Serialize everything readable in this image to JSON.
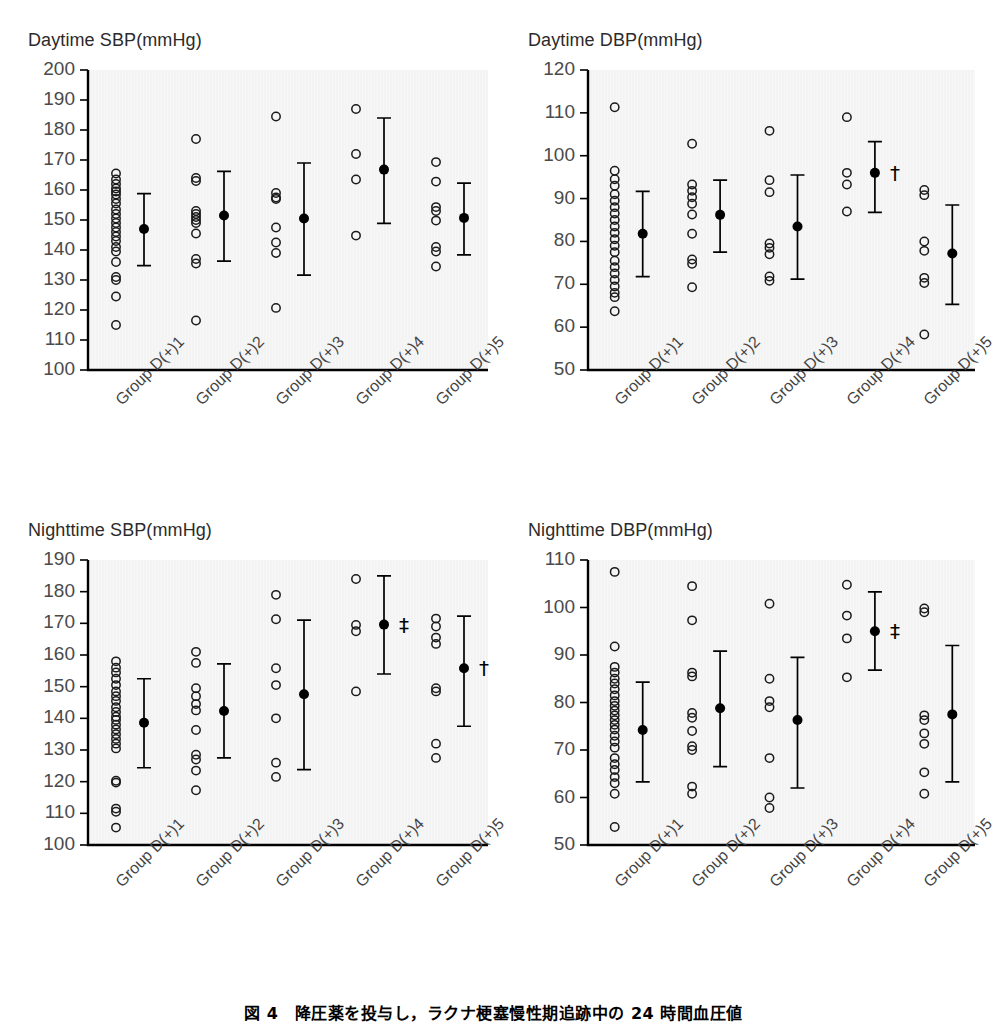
{
  "caption": "図 4　降圧薬を投与し，ラクナ梗塞慢性期追跡中の 24 時間血圧値",
  "groups": [
    "Group D(+)1",
    "Group D(+)2",
    "Group D(+)3",
    "Group D(+)4",
    "Group D(+)5"
  ],
  "chart_data": [
    {
      "id": "daytime-sbp",
      "type": "scatter",
      "title": "Daytime SBP(mmHg)",
      "xlabel": "",
      "ylabel": "Daytime SBP(mmHg)",
      "ylim": [
        100,
        200
      ],
      "yticks": [
        100,
        110,
        120,
        130,
        140,
        150,
        160,
        170,
        180,
        190,
        200
      ],
      "grid": false,
      "legend": "none",
      "categories": [
        "Group D(+)1",
        "Group D(+)2",
        "Group D(+)3",
        "Group D(+)4",
        "Group D(+)5"
      ],
      "series": [
        {
          "name": "Group D(+)1",
          "points": [
            165.5,
            163.5,
            162,
            160.5,
            159.5,
            158.5,
            157,
            155.5,
            153.5,
            152,
            150.5,
            149,
            147.5,
            146,
            144.5,
            143,
            141,
            139.5,
            136,
            131,
            130,
            124.5,
            115
          ],
          "mean": 147.0,
          "sd_low": 134.8,
          "sd_high": 158.8,
          "significance": ""
        },
        {
          "name": "Group D(+)2",
          "points": [
            177,
            164,
            163,
            153,
            152,
            151,
            150,
            149,
            145.5,
            137,
            135.5,
            116.5
          ],
          "mean": 151.5,
          "sd_low": 136.3,
          "sd_high": 166.2,
          "significance": ""
        },
        {
          "name": "Group D(+)3",
          "points": [
            184.5,
            159,
            157.5,
            157,
            147.5,
            142.5,
            139,
            120.7
          ],
          "mean": 150.5,
          "sd_low": 131.6,
          "sd_high": 169.0,
          "significance": ""
        },
        {
          "name": "Group D(+)4",
          "points": [
            187,
            172,
            163.5,
            144.8
          ],
          "mean": 166.8,
          "sd_low": 148.9,
          "sd_high": 184.0,
          "significance": ""
        },
        {
          "name": "Group D(+)5",
          "points": [
            169.3,
            162.8,
            154.3,
            153,
            149.8,
            141,
            139.5,
            134.5
          ],
          "mean": 150.7,
          "sd_low": 138.4,
          "sd_high": 162.3,
          "significance": ""
        }
      ]
    },
    {
      "id": "daytime-dbp",
      "type": "scatter",
      "title": "Daytime DBP(mmHg)",
      "xlabel": "",
      "ylabel": "Daytime DBP(mmHg)",
      "ylim": [
        50,
        120
      ],
      "yticks": [
        50,
        60,
        70,
        80,
        90,
        100,
        110,
        120
      ],
      "grid": false,
      "legend": "none",
      "categories": [
        "Group D(+)1",
        "Group D(+)2",
        "Group D(+)3",
        "Group D(+)4",
        "Group D(+)5"
      ],
      "series": [
        {
          "name": "Group D(+)1",
          "points": [
            111.3,
            96.5,
            94.5,
            93,
            91,
            89.5,
            88,
            86.5,
            85,
            83.5,
            82,
            80.5,
            79,
            77.5,
            75.5,
            74,
            72.5,
            71,
            69.5,
            68,
            67,
            63.7
          ],
          "mean": 81.8,
          "sd_low": 71.8,
          "sd_high": 91.7,
          "significance": ""
        },
        {
          "name": "Group D(+)2",
          "points": [
            102.8,
            93.3,
            91.8,
            90.3,
            88.8,
            86.3,
            81.8,
            75.8,
            74.8,
            69.3
          ],
          "mean": 86.2,
          "sd_low": 77.5,
          "sd_high": 94.3,
          "significance": ""
        },
        {
          "name": "Group D(+)3",
          "points": [
            105.8,
            94.3,
            91.5,
            79.5,
            78.5,
            77,
            71.8,
            70.8
          ],
          "mean": 83.5,
          "sd_low": 71.2,
          "sd_high": 95.5,
          "significance": ""
        },
        {
          "name": "Group D(+)4",
          "points": [
            109,
            96,
            93.3,
            87
          ],
          "mean": 96.0,
          "sd_low": 86.8,
          "sd_high": 103.3,
          "significance": "†"
        },
        {
          "name": "Group D(+)5",
          "points": [
            92,
            90.8,
            80,
            77.8,
            71.5,
            70.3,
            58.3
          ],
          "mean": 77.2,
          "sd_low": 65.3,
          "sd_high": 88.5,
          "significance": ""
        }
      ]
    },
    {
      "id": "nighttime-sbp",
      "type": "scatter",
      "title": "Nighttime SBP(mmHg)",
      "xlabel": "",
      "ylabel": "Nighttime SBP(mmHg)",
      "ylim": [
        100,
        190
      ],
      "yticks": [
        100,
        110,
        120,
        130,
        140,
        150,
        160,
        170,
        180,
        190
      ],
      "grid": false,
      "legend": "none",
      "categories": [
        "Group D(+)1",
        "Group D(+)2",
        "Group D(+)3",
        "Group D(+)4",
        "Group D(+)5"
      ],
      "series": [
        {
          "name": "Group D(+)1",
          "points": [
            158,
            156,
            154.5,
            152.5,
            150.5,
            148.5,
            147,
            145.5,
            143.5,
            142,
            140.5,
            139.5,
            138,
            136.5,
            135,
            133.5,
            132,
            130.5,
            120.3,
            119.7,
            111.5,
            110.5,
            105.5
          ],
          "mean": 138.6,
          "sd_low": 124.4,
          "sd_high": 152.5,
          "significance": ""
        },
        {
          "name": "Group D(+)2",
          "points": [
            161,
            157.5,
            149.5,
            147,
            144.5,
            142.5,
            136.3,
            128.5,
            127,
            123.5,
            117.3
          ],
          "mean": 142.3,
          "sd_low": 127.5,
          "sd_high": 157.2,
          "significance": ""
        },
        {
          "name": "Group D(+)3",
          "points": [
            179,
            171.3,
            155.8,
            150.5,
            140,
            126,
            121.5
          ],
          "mean": 147.6,
          "sd_low": 123.8,
          "sd_high": 171.0,
          "significance": ""
        },
        {
          "name": "Group D(+)4",
          "points": [
            184,
            169.5,
            167.5,
            148.5
          ],
          "mean": 169.6,
          "sd_low": 154.0,
          "sd_high": 185.0,
          "significance": "‡"
        },
        {
          "name": "Group D(+)5",
          "points": [
            171.5,
            169,
            165.5,
            163.5,
            149.5,
            148.5,
            132,
            127.5
          ],
          "mean": 155.8,
          "sd_low": 137.5,
          "sd_high": 172.3,
          "significance": "†"
        }
      ]
    },
    {
      "id": "nighttime-dbp",
      "type": "scatter",
      "title": "Nighttime DBP(mmHg)",
      "xlabel": "",
      "ylabel": "Nighttime DBP(mmHg)",
      "ylim": [
        50,
        110
      ],
      "yticks": [
        50,
        60,
        70,
        80,
        90,
        100,
        110
      ],
      "grid": false,
      "legend": "none",
      "categories": [
        "Group D(+)1",
        "Group D(+)2",
        "Group D(+)3",
        "Group D(+)4",
        "Group D(+)5"
      ],
      "series": [
        {
          "name": "Group D(+)1",
          "points": [
            107.5,
            91.8,
            87.5,
            86.3,
            85,
            84,
            82.8,
            81.5,
            80.3,
            79.3,
            78.3,
            77.3,
            76.3,
            75.3,
            74.3,
            73,
            71.8,
            70.5,
            68.3,
            67,
            65.8,
            64.3,
            63,
            60.8,
            53.8
          ],
          "mean": 74.2,
          "sd_low": 63.3,
          "sd_high": 84.3,
          "significance": ""
        },
        {
          "name": "Group D(+)2",
          "points": [
            104.5,
            97.3,
            86.3,
            85.5,
            77.8,
            76.8,
            74,
            70.8,
            70,
            62.3,
            60.8
          ],
          "mean": 78.8,
          "sd_low": 66.5,
          "sd_high": 90.8,
          "significance": ""
        },
        {
          "name": "Group D(+)3",
          "points": [
            100.8,
            85,
            80.3,
            79,
            68.3,
            60,
            57.8
          ],
          "mean": 76.3,
          "sd_low": 62.0,
          "sd_high": 89.5,
          "significance": ""
        },
        {
          "name": "Group D(+)4",
          "points": [
            104.8,
            98.3,
            93.5,
            85.3
          ],
          "mean": 95.0,
          "sd_low": 86.8,
          "sd_high": 103.3,
          "significance": "‡"
        },
        {
          "name": "Group D(+)5",
          "points": [
            99.8,
            99,
            77.3,
            76.3,
            73.5,
            71.3,
            65.3,
            60.8
          ],
          "mean": 77.5,
          "sd_low": 63.3,
          "sd_high": 92.0,
          "significance": ""
        }
      ]
    }
  ]
}
